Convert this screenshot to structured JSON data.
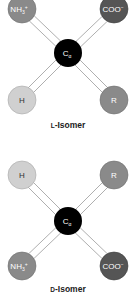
{
  "diagrams": [
    {
      "title": "L-Isomer",
      "title_small_cap": "L",
      "title_rest": "-Isomer",
      "center": {
        "label": "C",
        "sub": "α",
        "color": "#000000"
      },
      "atoms": [
        {
          "pos": "top-left",
          "label": "NH",
          "sub": "3",
          "sup": "+",
          "color": "#8a8a8a"
        },
        {
          "pos": "top-right",
          "label": "COO",
          "sup": "−",
          "color": "#555555"
        },
        {
          "pos": "bottom-left",
          "label": "H",
          "color": "#d0d0d0"
        },
        {
          "pos": "bottom-right",
          "label": "R",
          "color": "#8a8a8a"
        }
      ]
    },
    {
      "title": "D-Isomer",
      "title_small_cap": "D",
      "title_rest": "-Isomer",
      "center": {
        "label": "C",
        "sub": "α",
        "color": "#000000"
      },
      "atoms": [
        {
          "pos": "top-left",
          "label": "H",
          "color": "#d0d0d0"
        },
        {
          "pos": "top-right",
          "label": "R",
          "color": "#8a8a8a"
        },
        {
          "pos": "bottom-left",
          "label": "NH",
          "sub": "3",
          "sup": "+",
          "color": "#8a8a8a"
        },
        {
          "pos": "bottom-right",
          "label": "COO",
          "sup": "−",
          "color": "#555555"
        }
      ]
    }
  ]
}
